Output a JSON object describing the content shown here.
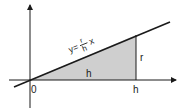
{
  "diagram": {
    "type": "triangle-under-line",
    "colors": {
      "line": "#1a1a1a",
      "fill": "#cfcfcf",
      "background": "#ffffff"
    },
    "labels": {
      "origin": "0",
      "x_axis_tick": "h",
      "base": "h",
      "height": "r",
      "equation_y": "y=",
      "equation_num": "r",
      "equation_den": "h",
      "equation_x": "x"
    }
  }
}
